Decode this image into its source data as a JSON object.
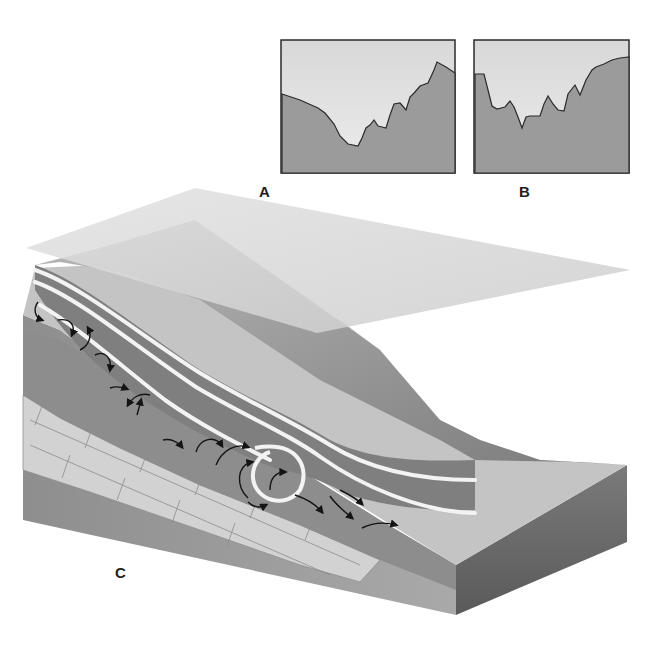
{
  "figure": {
    "panels": [
      {
        "id": "A",
        "label": "A",
        "type": "cross-section-profile"
      },
      {
        "id": "B",
        "label": "B",
        "type": "cross-section-profile"
      },
      {
        "id": "C",
        "label": "C",
        "type": "block-diagram"
      }
    ],
    "colors": {
      "background": "#ffffff",
      "sky_fill": "#e3e3e3",
      "ground_fill": "#9a9a9a",
      "outline": "#2b2b2b",
      "plane": "#d6d6d6",
      "flow_band": "#7f7f7f",
      "flow_stripe": "#f2f2f2",
      "bedrock": "#cfcfcf",
      "soil": "#8a8a8a",
      "front_face": "#6e6e6e",
      "arrow": "#141414"
    }
  }
}
